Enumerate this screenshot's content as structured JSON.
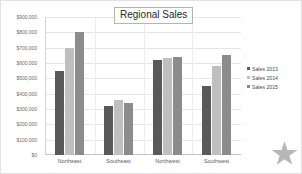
{
  "chart_data": {
    "type": "bar",
    "title": "Regional Sales",
    "xlabel": "",
    "ylabel": "",
    "ylim": [
      0,
      900000
    ],
    "grid": true,
    "legend_position": "right",
    "categories": [
      "Northeast",
      "Southeast",
      "Northwest",
      "Southwest"
    ],
    "ytick_labels": [
      "$900,000",
      "$800,000",
      "$700,000",
      "$600,000",
      "$500,000",
      "$400,000",
      "$300,000",
      "$200,000",
      "$100,000",
      "$0"
    ],
    "ytick_values": [
      900000,
      800000,
      700000,
      600000,
      500000,
      400000,
      300000,
      200000,
      100000,
      0
    ],
    "series": [
      {
        "name": "Sales 2013",
        "color": "#595959",
        "values": [
          550000,
          320000,
          620000,
          450000
        ]
      },
      {
        "name": "Sales 2014",
        "color": "#bfbfbf",
        "values": [
          700000,
          360000,
          630000,
          580000
        ]
      },
      {
        "name": "Sales 2015",
        "color": "#8c8c8c",
        "values": [
          800000,
          340000,
          640000,
          650000
        ]
      }
    ]
  },
  "decoration": {
    "star_icon": "star-icon"
  }
}
